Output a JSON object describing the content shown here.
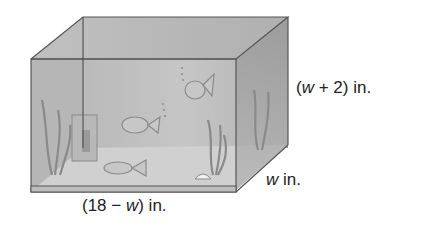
{
  "figure": {
    "labels": {
      "height": {
        "pre": "(",
        "var": "w",
        "post": " + 2) in."
      },
      "depth": {
        "pre": "",
        "var": "w",
        "post": " in."
      },
      "length": {
        "pre": "(18 − ",
        "var": "w",
        "post": ") in."
      }
    },
    "colors": {
      "glass": "#a9a9a9",
      "edge": "#555555",
      "sand": "#d9d9d9",
      "plant": "#8a8a8a"
    }
  }
}
